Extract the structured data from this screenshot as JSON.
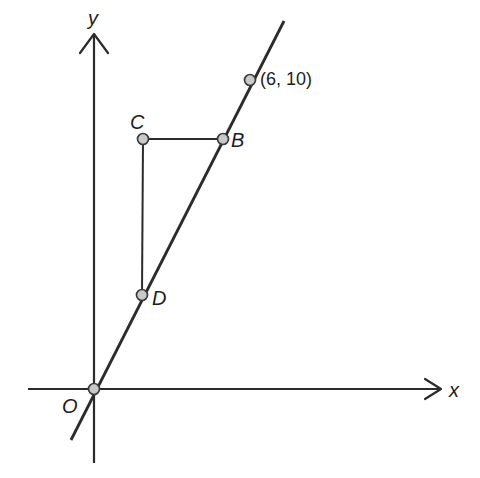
{
  "figure": {
    "type": "coordinate-geometry-diagram",
    "background_color": "#ffffff",
    "line_color": "#2b2b2b",
    "marker_fill_color": "#c9c9c9",
    "marker_stroke_color": "#3a3a3a"
  },
  "axes": {
    "x_label": "x",
    "y_label": "y",
    "origin_label": "O",
    "x_axis": {
      "x1": 28,
      "y1": 389,
      "x2": 440,
      "y2": 389,
      "arrow": "right"
    },
    "y_axis": {
      "x1": 94,
      "y1": 463,
      "x2": 94,
      "y2": 35,
      "arrow": "up"
    }
  },
  "points": [
    {
      "name": "O",
      "label": "O",
      "cx": 94,
      "cy": 389,
      "r": 5.5
    },
    {
      "name": "D",
      "label": "D",
      "cx": 142,
      "cy": 295,
      "r": 5.5
    },
    {
      "name": "C",
      "label": "C",
      "cx": 143,
      "cy": 139,
      "r": 5.5
    },
    {
      "name": "B",
      "label": "B",
      "cx": 223,
      "cy": 139,
      "r": 5.5
    },
    {
      "name": "P6_10",
      "label": "(6, 10)",
      "cx": 250,
      "cy": 80,
      "r": 5.5
    }
  ],
  "segments": [
    {
      "name": "line-through-origin",
      "x1": 71,
      "y1": 440,
      "x2": 284,
      "y2": 21
    },
    {
      "name": "segment-CB",
      "x1": 143,
      "y1": 139,
      "x2": 223,
      "y2": 139
    },
    {
      "name": "segment-CD",
      "x1": 143,
      "y1": 139,
      "x2": 142,
      "y2": 295
    }
  ],
  "annotations": {
    "coordinate_label": "(6, 10)"
  }
}
